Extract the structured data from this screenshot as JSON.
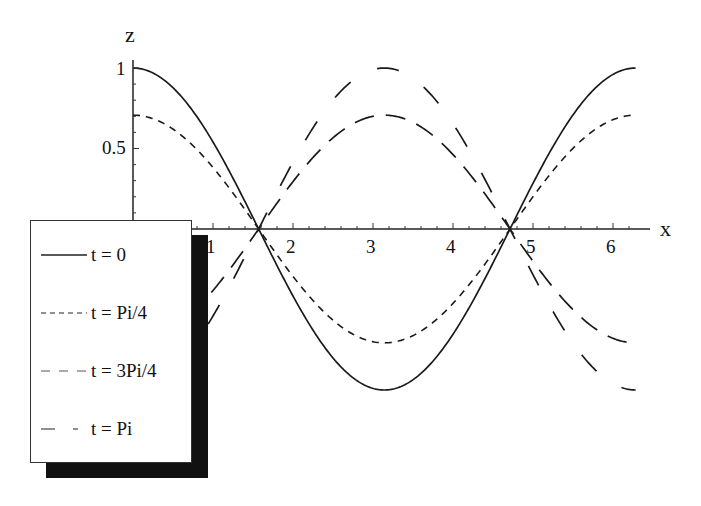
{
  "chart_data": {
    "type": "line",
    "title": "",
    "xlabel": "x",
    "ylabel": "z",
    "xlim": [
      0,
      6.2832
    ],
    "ylim": [
      -1,
      1
    ],
    "grid": false,
    "legend_position": "lower-left, overlapping plot, with drop shadow",
    "x_ticks": [
      "1",
      "2",
      "3",
      "4",
      "5",
      "6"
    ],
    "y_ticks": [
      "0.5",
      "1"
    ],
    "function": "z = cos(x) * cos(t)",
    "x": [
      0,
      0.5,
      1.0,
      1.5708,
      2.0,
      2.5,
      3.1416,
      3.5,
      4.0,
      4.7124,
      5.0,
      5.5,
      6.2832
    ],
    "series": [
      {
        "name": "t = 0",
        "style": "solid",
        "values": [
          1.0,
          0.878,
          0.54,
          0.0,
          -0.416,
          -0.801,
          -1.0,
          -0.936,
          -0.654,
          0.0,
          0.284,
          0.709,
          1.0
        ]
      },
      {
        "name": "t = Pi/4",
        "style": "short-dash",
        "values": [
          0.707,
          0.621,
          0.382,
          0.0,
          -0.294,
          -0.566,
          -0.707,
          -0.662,
          -0.462,
          0.0,
          0.201,
          0.501,
          0.707
        ]
      },
      {
        "name": "t = 3Pi/4",
        "style": "medium-dash",
        "values": [
          -0.707,
          -0.621,
          -0.382,
          0.0,
          0.294,
          0.566,
          0.707,
          0.662,
          0.462,
          0.0,
          -0.201,
          -0.501,
          -0.707
        ]
      },
      {
        "name": "t = Pi",
        "style": "long-dash",
        "values": [
          -1.0,
          -0.878,
          -0.54,
          0.0,
          0.416,
          0.801,
          1.0,
          0.936,
          0.654,
          0.0,
          -0.284,
          -0.709,
          -1.0
        ]
      }
    ]
  },
  "axes": {
    "x_label": "x",
    "y_label": "z",
    "x_tick_labels": [
      "1",
      "2",
      "3",
      "4",
      "5",
      "6"
    ],
    "y_tick_labels": [
      "0.5",
      "1"
    ]
  },
  "legend": {
    "items": [
      {
        "label": "t = 0"
      },
      {
        "label": "t = Pi/4"
      },
      {
        "label": "t = 3Pi/4"
      },
      {
        "label": "t = Pi"
      }
    ]
  }
}
